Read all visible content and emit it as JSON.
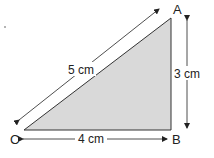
{
  "diagram": {
    "vertices": {
      "A": {
        "label": "A"
      },
      "B": {
        "label": "B"
      },
      "C": {
        "label": "C"
      }
    },
    "sides": {
      "hypotenuse": {
        "label": "5 cm"
      },
      "vertical": {
        "label": "3 cm"
      },
      "horizontal": {
        "label": "4 cm"
      }
    },
    "colors": {
      "fill": "#d9d9d9",
      "stroke": "#333333"
    }
  }
}
